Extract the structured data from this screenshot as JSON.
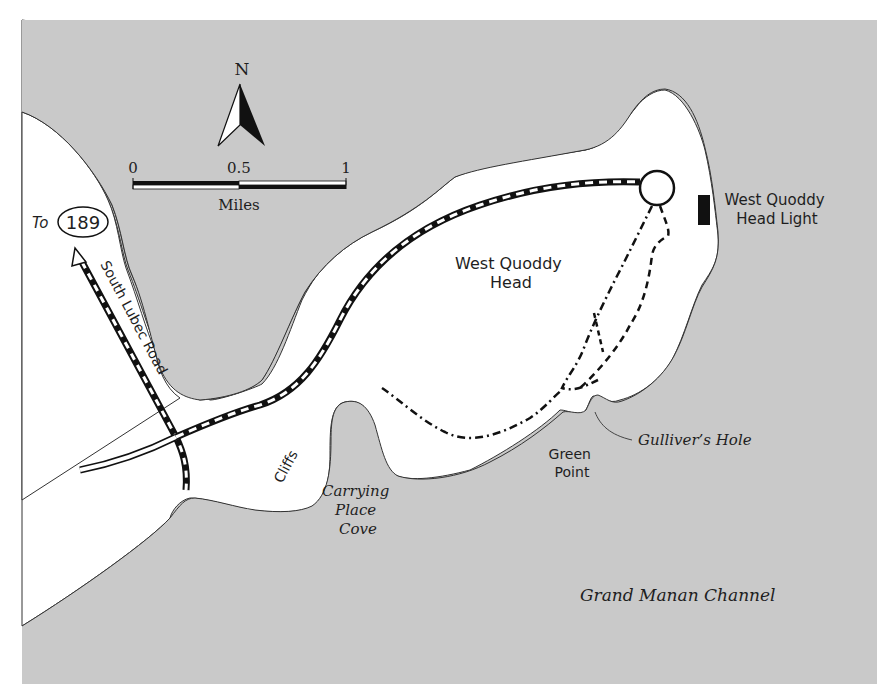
{
  "map": {
    "water_color": "#c9c9c9",
    "land_color": "#ffffff",
    "line_color": "#111111"
  },
  "compass": {
    "north_label": "N"
  },
  "scale_bar": {
    "ticks": [
      "0",
      "0.5",
      "1"
    ],
    "unit": "Miles"
  },
  "route_shield": {
    "prefix": "To",
    "number": "189"
  },
  "labels": {
    "south_lubec_road": "South Lubec Road",
    "west_quoddy_head_line1": "West Quoddy",
    "west_quoddy_head_line2": "Head",
    "lighthouse_line1": "West Quoddy",
    "lighthouse_line2": "Head Light",
    "cliffs": "Cliffs",
    "carrying_place_cove_line1": "Carrying",
    "carrying_place_cove_line2": "Place",
    "carrying_place_cove_line3": "Cove",
    "green_point_line1": "Green",
    "green_point_line2": "Point",
    "gullivers_hole": "Gulliver’s Hole",
    "grand_manan_channel": "Grand Manan Channel"
  }
}
